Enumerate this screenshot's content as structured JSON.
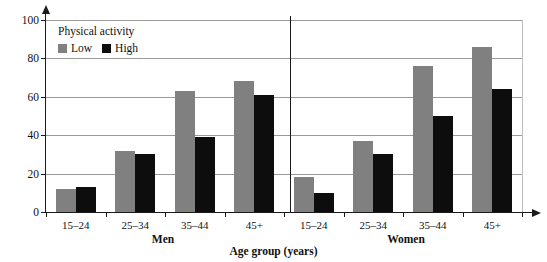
{
  "chart_data": {
    "type": "bar",
    "title": "",
    "xlabel": "Age group (years)",
    "ylabel": "Incidence (per 1000 person-years)",
    "ylim": [
      0,
      100
    ],
    "yticks": [
      0,
      20,
      40,
      60,
      80,
      100
    ],
    "grid": true,
    "legend": {
      "title": "Physical activity",
      "position": "top-left",
      "entries": [
        {
          "name": "Low",
          "color": "#808080"
        },
        {
          "name": "High",
          "color": "#0d0d0d"
        }
      ]
    },
    "panels": [
      {
        "label": "Men",
        "categories": [
          "15–24",
          "25–34",
          "35–44",
          "45+"
        ]
      },
      {
        "label": "Women",
        "categories": [
          "15–24",
          "25–34",
          "35–44",
          "45+"
        ]
      }
    ],
    "categories": [
      "15–24",
      "25–34",
      "35–44",
      "45+",
      "15–24",
      "25–34",
      "35–44",
      "45+"
    ],
    "series": [
      {
        "name": "Low",
        "color": "#808080",
        "values": [
          12,
          32,
          63,
          68,
          18,
          37,
          76,
          86
        ]
      },
      {
        "name": "High",
        "color": "#0d0d0d",
        "values": [
          13,
          30,
          39,
          61,
          10,
          30,
          50,
          64
        ]
      }
    ]
  },
  "axis": {
    "ytick_labels": [
      "0",
      "20",
      "40",
      "60",
      "80",
      "100"
    ],
    "ylabel": "Incidence (per 1000 person-years)",
    "xlabel": "Age group (years)"
  },
  "groups": {
    "men_label": "Men",
    "women_label": "Women"
  },
  "legend": {
    "title": "Physical activity",
    "low_label": "Low",
    "high_label": "High"
  },
  "colors": {
    "low": "#808080",
    "high": "#0d0d0d",
    "axis": "#1a1a1a",
    "grid": "#9a9a9a",
    "background": "#ffffff"
  }
}
